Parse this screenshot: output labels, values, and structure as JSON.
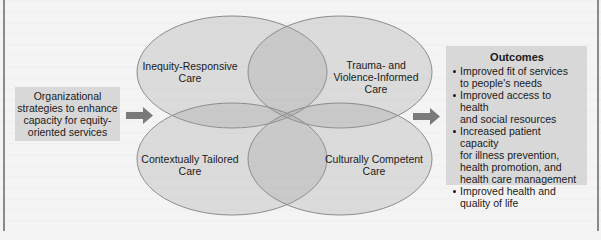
{
  "diagram": {
    "input": {
      "lines": [
        "Organizational",
        "strategies to enhance",
        "capacity for equity-",
        "oriented services"
      ]
    },
    "dimensions": [
      {
        "id": "top-left",
        "lines": [
          "Inequity-Responsive",
          "Care"
        ]
      },
      {
        "id": "top-right",
        "lines": [
          "Trauma- and",
          "Violence-Informed",
          "Care"
        ]
      },
      {
        "id": "bottom-left",
        "lines": [
          "Contextually Tailored",
          "Care"
        ]
      },
      {
        "id": "bottom-right",
        "lines": [
          "Culturally Competent",
          "Care"
        ]
      }
    ],
    "outcomes": {
      "title": "Outcomes",
      "items": [
        [
          "Improved fit of services",
          "to people's needs"
        ],
        [
          "Improved access to health",
          "and social resources"
        ],
        [
          "Increased patient capacity",
          "for illness prevention,",
          "health promotion, and",
          "health care management"
        ],
        [
          "Improved health and",
          "quality of life"
        ]
      ]
    },
    "colors": {
      "background": "#f4f4f4",
      "box_fill": "#d8d8d8",
      "ellipse_fill": "#d9d9d9",
      "ellipse_stroke": "#8c8c8c",
      "arrow": "#7a7a7a"
    }
  }
}
